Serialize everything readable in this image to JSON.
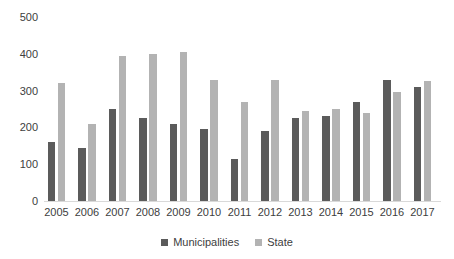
{
  "chart_data": {
    "type": "bar",
    "title": "",
    "categories": [
      "2005",
      "2006",
      "2007",
      "2008",
      "2009",
      "2010",
      "2011",
      "2012",
      "2013",
      "2014",
      "2015",
      "2016",
      "2017"
    ],
    "series": [
      {
        "name": "Municipalities",
        "color": "#5b5b5b",
        "values": [
          160,
          145,
          250,
          225,
          210,
          195,
          115,
          190,
          225,
          230,
          270,
          330,
          310
        ]
      },
      {
        "name": "State",
        "color": "#b3b3b3",
        "values": [
          320,
          210,
          395,
          400,
          405,
          330,
          270,
          330,
          245,
          250,
          240,
          295,
          325
        ]
      }
    ],
    "xlabel": "",
    "ylabel": "",
    "ylim": [
      0,
      500
    ],
    "y_ticks": [
      0,
      100,
      200,
      300,
      400,
      500
    ],
    "grid": false,
    "legend_position": "bottom"
  },
  "style": {
    "axis_line_color": "#d9d9d9",
    "label_color": "#404040",
    "background": "#ffffff"
  }
}
